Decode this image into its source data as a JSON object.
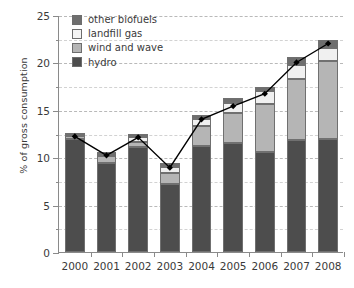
{
  "chart_data": {
    "type": "bar",
    "stacked": true,
    "title": "",
    "xlabel": "",
    "ylabel": "% of gross consumption",
    "ylim": [
      0,
      25
    ],
    "ytick_values": [
      0,
      5,
      10,
      15,
      20,
      25
    ],
    "ytick_labels": [
      "0",
      "5",
      "10",
      "15",
      "20",
      "25"
    ],
    "yminor_values": [
      2.5,
      7.5,
      12.5,
      17.5,
      22.5
    ],
    "grid": true,
    "legend_position": "top-left",
    "categories": [
      "2000",
      "2001",
      "2002",
      "2003",
      "2004",
      "2005",
      "2006",
      "2007",
      "2008"
    ],
    "series": [
      {
        "name": "hydro",
        "color": "#4d4d4d",
        "values": [
          11.9,
          9.4,
          11.1,
          7.2,
          11.2,
          11.5,
          10.6,
          11.8,
          11.9
        ]
      },
      {
        "name": "wind and wave",
        "color": "#b5b5b5",
        "values": [
          0.35,
          0.7,
          0.55,
          1.1,
          2.1,
          3.2,
          5.0,
          6.5,
          8.2
        ]
      },
      {
        "name": "landfill gas",
        "color": "#f0f0f0",
        "values": [
          0.1,
          0.25,
          0.45,
          0.7,
          0.7,
          1.0,
          1.4,
          1.4,
          1.4
        ]
      },
      {
        "name": "other biofuels",
        "color": "#6e6e6e",
        "values": [
          0.15,
          0.15,
          0.4,
          0.4,
          0.5,
          0.5,
          0.4,
          0.9,
          0.9
        ]
      }
    ],
    "totals": [
      12.5,
      10.5,
      12.5,
      9.4,
      14.5,
      16.2,
      17.4,
      20.6,
      22.4
    ],
    "overlay_line": {
      "name": "total trend",
      "color": "#000000",
      "marker": "diamond",
      "values": [
        12.3,
        10.3,
        12.2,
        9.0,
        14.1,
        15.5,
        16.8,
        20.1,
        22.1
      ]
    },
    "legend_entries": [
      {
        "label": "other biofuels",
        "color": "#6e6e6e"
      },
      {
        "label": "landfill gas",
        "color": "#f4f4f4"
      },
      {
        "label": "wind and wave",
        "color": "#b5b5b5"
      },
      {
        "label": "hydro",
        "color": "#4d4d4d"
      }
    ]
  }
}
